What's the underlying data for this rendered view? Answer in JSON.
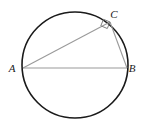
{
  "figure": {
    "canvas": {
      "width": 151,
      "height": 131,
      "background": "#ffffff"
    },
    "colors": {
      "circle_stroke": "#1a1a1a",
      "chord_stroke": "#9a9a9a",
      "label_fill": "#1a1a1a",
      "right_angle_stroke": "#808080"
    },
    "circle": {
      "name": "circumscribed-circle",
      "cx": 75,
      "cy": 65,
      "r": 53,
      "stroke_width": 1.6
    },
    "points": [
      {
        "id": "A",
        "label": "A",
        "x": 23,
        "y": 68,
        "label_x": 12,
        "label_y": 72
      },
      {
        "id": "B",
        "label": "B",
        "x": 127,
        "y": 68,
        "label_x": 132,
        "label_y": 72
      },
      {
        "id": "C",
        "label": "C",
        "x": 110,
        "y": 22,
        "label_x": 114,
        "label_y": 18
      }
    ],
    "segments": [
      {
        "id": "AB",
        "name": "segment-ab",
        "from": "A",
        "to": "B",
        "stroke_width": 1.1
      },
      {
        "id": "AC",
        "name": "segment-ac",
        "from": "A",
        "to": "C",
        "stroke_width": 1.1
      },
      {
        "id": "CB",
        "name": "segment-cb",
        "from": "C",
        "to": "B",
        "stroke_width": 1.1
      }
    ],
    "right_angle": {
      "name": "right-angle-marker-c",
      "at": "C",
      "size": 7,
      "stroke_width": 1.0,
      "points": "110,22 103.5,19.3 100.8,25.8 107.3,28.5"
    },
    "label_font_size": 11
  }
}
